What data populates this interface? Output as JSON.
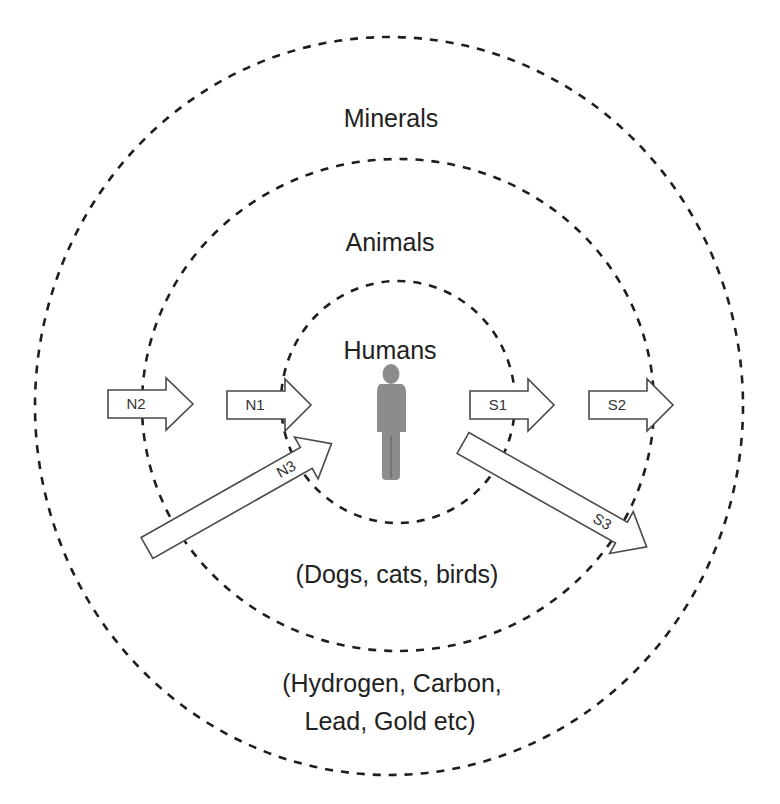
{
  "diagram": {
    "rings": [
      {
        "id": "minerals",
        "title": "Minerals",
        "subtitle_lines": [
          "(Hydrogen, Carbon,",
          "Lead, Gold etc)"
        ]
      },
      {
        "id": "animals",
        "title": "Animals",
        "subtitle_lines": [
          "(Dogs, cats, birds)"
        ]
      },
      {
        "id": "humans",
        "title": "Humans",
        "subtitle_lines": []
      }
    ],
    "arrows": [
      {
        "id": "N2",
        "label": "N2",
        "direction": "right"
      },
      {
        "id": "N1",
        "label": "N1",
        "direction": "right"
      },
      {
        "id": "N3",
        "label": "N3",
        "direction": "up-right"
      },
      {
        "id": "S1",
        "label": "S1",
        "direction": "right"
      },
      {
        "id": "S2",
        "label": "S2",
        "direction": "right"
      },
      {
        "id": "S3",
        "label": "S3",
        "direction": "down-right"
      }
    ],
    "center_icon": "person-icon",
    "colors": {
      "ring_stroke": "#1e1e1e",
      "arrow_stroke": "#4a4a4a",
      "person_fill": "#8c8c8c",
      "text": "#222222"
    }
  }
}
